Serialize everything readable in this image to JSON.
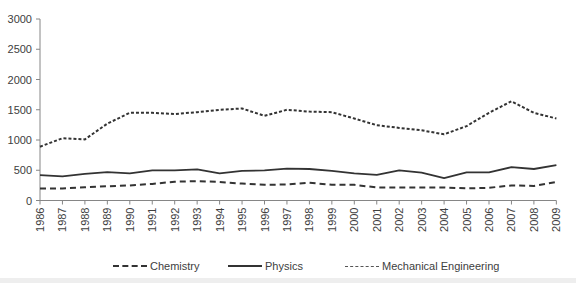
{
  "chart_data": {
    "type": "line",
    "title": "",
    "xlabel": "",
    "ylabel": "",
    "ylim": [
      0,
      3000
    ],
    "yticks": [
      0,
      500,
      1000,
      1500,
      2000,
      2500,
      3000
    ],
    "grid": false,
    "legend_position": "bottom",
    "x": [
      1986,
      1987,
      1988,
      1989,
      1990,
      1991,
      1992,
      1993,
      1994,
      1995,
      1996,
      1997,
      1998,
      1999,
      2000,
      2001,
      2002,
      2003,
      2004,
      2005,
      2006,
      2007,
      2008,
      2009
    ],
    "series": [
      {
        "name": "Chemistry",
        "style": "short-dash",
        "values": [
          890,
          1030,
          1010,
          1270,
          1450,
          1450,
          1430,
          1460,
          1500,
          1520,
          1400,
          1500,
          1470,
          1460,
          1355,
          1245,
          1200,
          1160,
          1095,
          1230,
          1450,
          1640,
          1450,
          1355
        ]
      },
      {
        "name": "Physics",
        "style": "solid",
        "values": [
          420,
          400,
          440,
          470,
          450,
          500,
          500,
          515,
          450,
          490,
          500,
          525,
          520,
          490,
          450,
          425,
          500,
          460,
          370,
          465,
          465,
          550,
          520,
          585
        ]
      },
      {
        "name": "Mechanical Engineering",
        "style": "long-dash",
        "values": [
          200,
          200,
          220,
          235,
          250,
          275,
          310,
          320,
          305,
          280,
          260,
          265,
          295,
          260,
          260,
          215,
          215,
          215,
          215,
          200,
          210,
          250,
          240,
          305
        ]
      }
    ]
  },
  "legend": {
    "items": [
      {
        "label": "Chemistry"
      },
      {
        "label": "Physics"
      },
      {
        "label": "Mechanical Engineering"
      }
    ]
  },
  "colors": {
    "line": "#333333",
    "axis": "#868686",
    "text": "#404040"
  }
}
